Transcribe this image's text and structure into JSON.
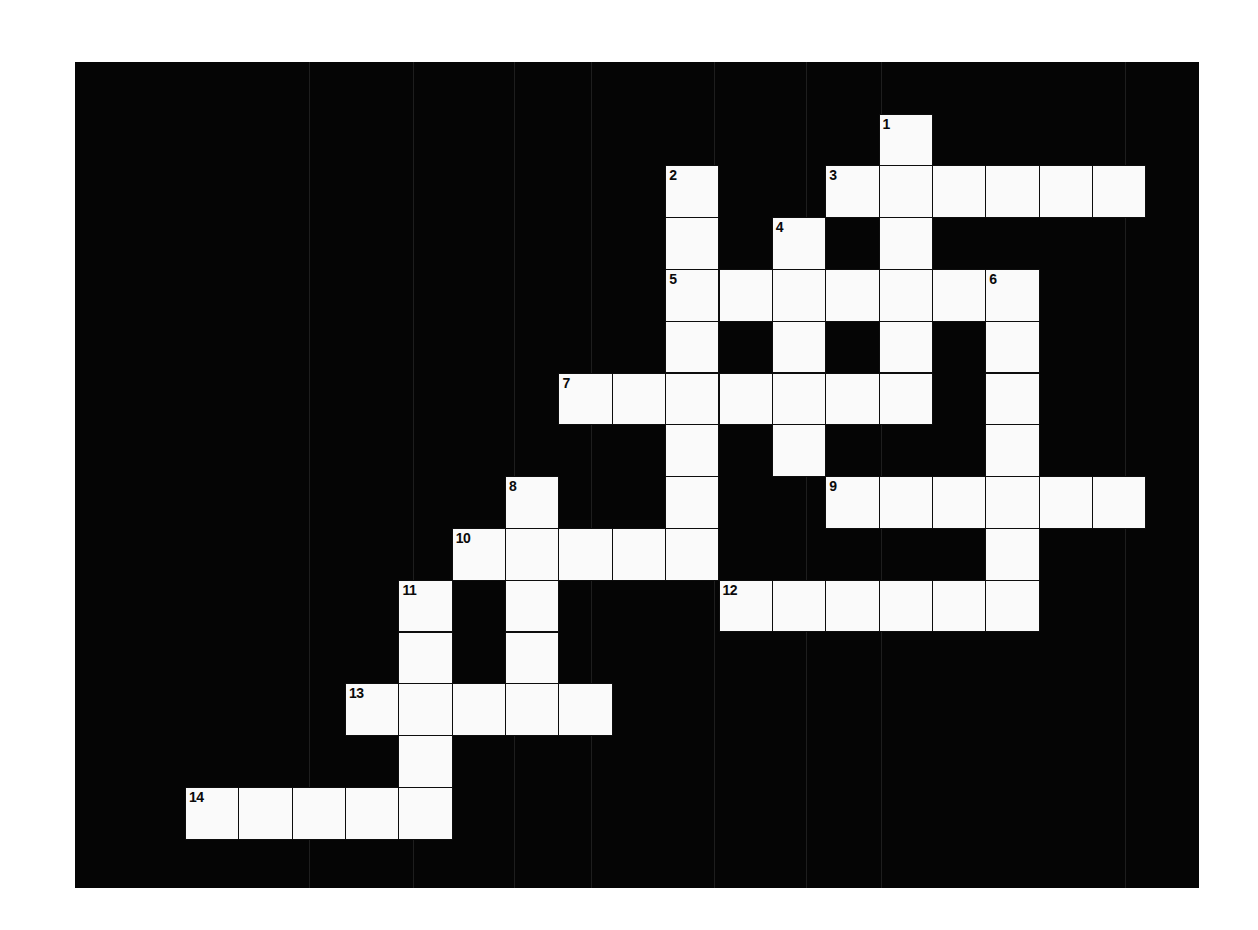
{
  "puzzle": {
    "title": "",
    "colors": {
      "board": "#050505",
      "cell": "#fafafa",
      "grid_line": "#0d0d0d",
      "page": "#ffffff"
    },
    "grid": {
      "cols": 18,
      "rows": 14,
      "cell_w": 53.35,
      "cell_h": 51.8,
      "origin_x": 110,
      "origin_y": 51.5
    },
    "entries": [
      {
        "number": "1",
        "direction": "down",
        "col": 13,
        "row": 0,
        "length": 6
      },
      {
        "number": "2",
        "direction": "down",
        "col": 9,
        "row": 1,
        "length": 8
      },
      {
        "number": "3",
        "direction": "across",
        "col": 12,
        "row": 1,
        "length": 6
      },
      {
        "number": "4",
        "direction": "down",
        "col": 11,
        "row": 2,
        "length": 5
      },
      {
        "number": "5",
        "direction": "across",
        "col": 9,
        "row": 3,
        "length": 7
      },
      {
        "number": "6",
        "direction": "down",
        "col": 15,
        "row": 3,
        "length": 7
      },
      {
        "number": "7",
        "direction": "across",
        "col": 7,
        "row": 5,
        "length": 7
      },
      {
        "number": "8",
        "direction": "down",
        "col": 6,
        "row": 7,
        "length": 5
      },
      {
        "number": "9",
        "direction": "across",
        "col": 12,
        "row": 7,
        "length": 6
      },
      {
        "number": "10",
        "direction": "across",
        "col": 5,
        "row": 8,
        "length": 5
      },
      {
        "number": "11",
        "direction": "down",
        "col": 4,
        "row": 9,
        "length": 5
      },
      {
        "number": "12",
        "direction": "across",
        "col": 10,
        "row": 9,
        "length": 6
      },
      {
        "number": "13",
        "direction": "across",
        "col": 3,
        "row": 11,
        "length": 5
      },
      {
        "number": "14",
        "direction": "across",
        "col": 0,
        "row": 13,
        "length": 5
      }
    ],
    "scanlines_x": [
      309,
      413,
      514,
      591,
      714,
      806,
      881,
      1125
    ]
  }
}
